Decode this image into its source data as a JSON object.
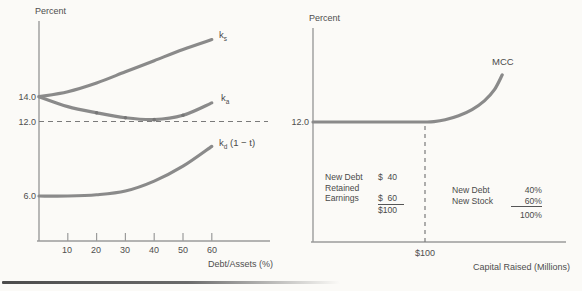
{
  "page": {
    "background": "#fbfaf7",
    "ink_color": "#4e4e4e",
    "curve_color": "#8a8a8a",
    "axis_color": "#9b9b9b",
    "dash_color": "#7a7a7a"
  },
  "chart_data": [
    {
      "type": "line",
      "panel": "left",
      "y_axis_label": "Percent",
      "x_axis_label": "Debt/Assets (%)",
      "x_ticks": [
        "10",
        "20",
        "30",
        "40",
        "50",
        "60"
      ],
      "y_tick_labels": [
        "14.0",
        "12.0",
        "6.0"
      ],
      "y_tick_values": [
        14.0,
        12.0,
        6.0
      ],
      "xlim": [
        0,
        80
      ],
      "grid": false,
      "dashed_hline_y": 12.0,
      "series": [
        {
          "name": "ks",
          "label_main": "k",
          "label_sub": "s",
          "x": [
            0,
            10,
            20,
            30,
            40,
            50,
            60
          ],
          "y": [
            14.0,
            14.4,
            15.1,
            16.0,
            16.9,
            17.8,
            18.6
          ]
        },
        {
          "name": "ka",
          "label_main": "k",
          "label_sub": "a",
          "x": [
            0,
            10,
            20,
            30,
            40,
            50,
            60
          ],
          "y": [
            14.0,
            13.2,
            12.7,
            12.3,
            12.15,
            12.5,
            13.5
          ],
          "marker_x": [
            20,
            30,
            40,
            50
          ]
        },
        {
          "name": "kd_after_tax",
          "label_main": "k",
          "label_sub": "d",
          "label_suffix": " (1 − t)",
          "x": [
            0,
            10,
            20,
            30,
            40,
            50,
            60
          ],
          "y": [
            6.0,
            6.0,
            6.1,
            6.4,
            7.2,
            8.4,
            10.0
          ]
        }
      ]
    },
    {
      "type": "line",
      "panel": "right",
      "y_axis_label": "Percent",
      "x_axis_label": "Capital Raised (Millions)",
      "x_ticks": [
        "$100"
      ],
      "y_tick_labels": [
        "12.0"
      ],
      "y_tick_values": [
        12.0
      ],
      "grid": false,
      "dashed_vline_x": 100,
      "series": [
        {
          "name": "MCC",
          "label_main": "MCC",
          "x": [
            0,
            40,
            80,
            100,
            108,
            118,
            130,
            142,
            153,
            162,
            169
          ],
          "y": [
            12,
            12,
            12,
            12,
            12.03,
            12.18,
            12.5,
            13.0,
            13.7,
            14.6,
            15.8
          ]
        }
      ],
      "annotations": {
        "financing_mix_dollars": {
          "rows": [
            {
              "label": "New Debt",
              "value": "$  40"
            },
            {
              "label": "Retained",
              "value": ""
            },
            {
              "label": "Earnings",
              "value": "$  60"
            },
            {
              "label": "",
              "value": "$100"
            }
          ]
        },
        "financing_mix_percent": {
          "rows": [
            {
              "label": "New Debt",
              "value": "40%"
            },
            {
              "label": "New Stock",
              "value": "60%"
            },
            {
              "label": "",
              "value": "100%"
            }
          ]
        }
      }
    }
  ]
}
